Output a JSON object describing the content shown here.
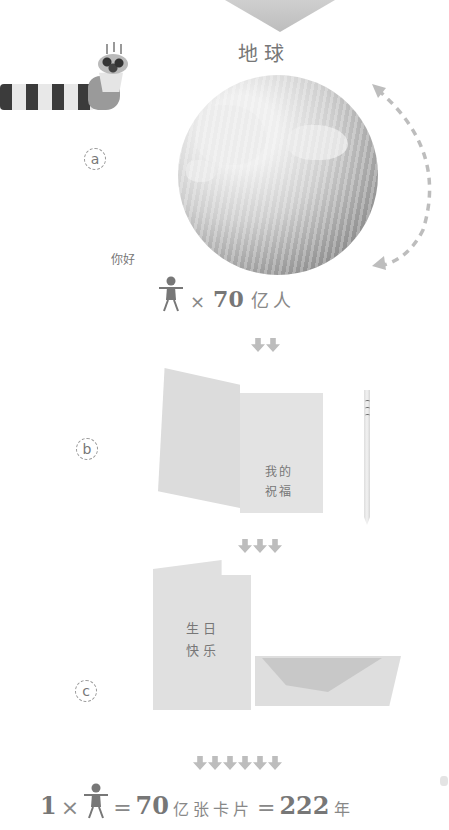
{
  "diagram": {
    "title": "地球",
    "steps": [
      {
        "label": "a",
        "greeting": "你好",
        "count_prefix": "×",
        "count_number": "70",
        "count_unit": "亿人",
        "arrows_after": 2
      },
      {
        "label": "b",
        "card_text": [
          "我的",
          "祝福"
        ],
        "arrows_after": 3
      },
      {
        "label": "c",
        "card_text": [
          "生日",
          "快乐"
        ],
        "arrows_after": 6
      }
    ],
    "formula": {
      "multiplier": "1",
      "times": "×",
      "equals1": "=",
      "cards_number": "70",
      "cards_unit": "亿张卡片",
      "equals2": "=",
      "years_number": "222",
      "years_unit": "年"
    },
    "icons": [
      "birthday-cupcake-hand",
      "earth-globe",
      "orbit-arrow",
      "person-icon",
      "down-arrow",
      "greeting-card",
      "pencil",
      "envelope"
    ],
    "colors": {
      "ink": "#777777",
      "arrow": "#bdbdbd",
      "stripe_dark": "#3b3b3b"
    }
  }
}
